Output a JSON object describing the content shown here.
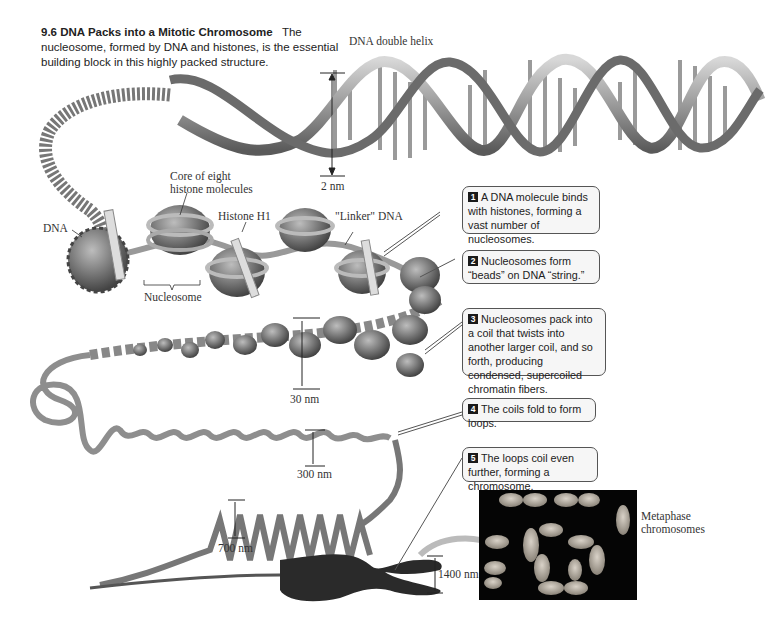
{
  "figure": {
    "number": "9.6",
    "title": "DNA Packs into a Mitotic Chromosome",
    "description": "The nucleosome, formed by DNA and histones, is the essential building block in this highly packed structure."
  },
  "labels": {
    "dna_double_helix": "DNA double helix",
    "two_nm": "2 nm",
    "core_line1": "Core of eight",
    "core_line2": "histone molecules",
    "histone_h1": "Histone H1",
    "linker_dna": "\"Linker\" DNA",
    "dna": "DNA",
    "nucleosome": "Nucleosome",
    "thirty_nm": "30 nm",
    "three_hundred_nm": "300 nm",
    "seven_hundred_nm": "700 nm",
    "fourteen_hundred_nm": "1400 nm",
    "metaphase_line1": "Metaphase",
    "metaphase_line2": "chromosomes"
  },
  "callouts": [
    {
      "step": "1",
      "text": "A DNA molecule binds with histones, forming a vast number of nucleosomes."
    },
    {
      "step": "2",
      "text": "Nucleosomes form “beads” on DNA “string.”"
    },
    {
      "step": "3",
      "text": "Nucleosomes pack into a coil that twists into another larger coil, and so forth, producing condensed, supercoiled chromatin fibers."
    },
    {
      "step": "4",
      "text": "The coils fold to form loops."
    },
    {
      "step": "5",
      "text": "The loops coil even further, forming a chromosome."
    }
  ],
  "colors": {
    "background": "#ffffff",
    "structure_gray": "#7a7a7a",
    "callout_fill": "#f6f6f6",
    "micrograph_bg": "#050505"
  }
}
